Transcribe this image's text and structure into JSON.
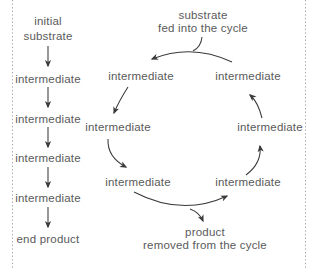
{
  "colors": {
    "background": "#ffffff",
    "text": "#5a5a5a",
    "arrow": "#3a3a3a",
    "dotted_line": "#9e9e9e"
  },
  "linear_pathway": {
    "initial_line1": "initial",
    "initial_line2": "substrate",
    "steps": [
      "intermediate",
      "intermediate",
      "intermediate",
      "intermediate"
    ],
    "end_label": "end product"
  },
  "cycle": {
    "input_line1": "substrate",
    "input_line2": "fed into the cycle",
    "nodes": {
      "top_left": "intermediate",
      "top_right": "intermediate",
      "left": "intermediate",
      "right": "intermediate",
      "bottom_left": "intermediate",
      "bottom_right": "intermediate"
    },
    "output_line1": "product",
    "output_line2": "removed from the cycle"
  }
}
